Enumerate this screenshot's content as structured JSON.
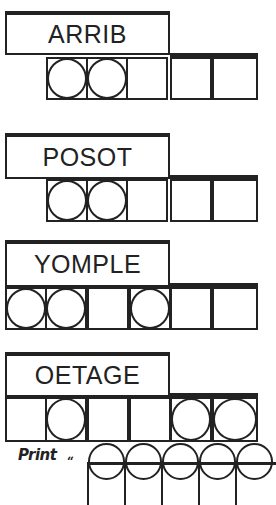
{
  "puzzles": [
    {
      "scrambled": "ARRIB",
      "num_cells": 5,
      "circled_cells": [
        1,
        2
      ]
    },
    {
      "scrambled": "POSOT",
      "num_cells": 5,
      "circled_cells": [
        1,
        2
      ]
    },
    {
      "scrambled": "YOMPLE",
      "num_cells": 6,
      "circled_cells": [
        1,
        2,
        4
      ]
    },
    {
      "scrambled": "OETAGE",
      "num_cells": 6,
      "circled_cells": [
        2,
        5,
        6
      ]
    }
  ],
  "answer": {
    "prompt_label": "Print",
    "open_quote": "“",
    "visible_circled_cells": 5
  },
  "colors": {
    "ink": "#222222",
    "background": "#ffffff"
  }
}
